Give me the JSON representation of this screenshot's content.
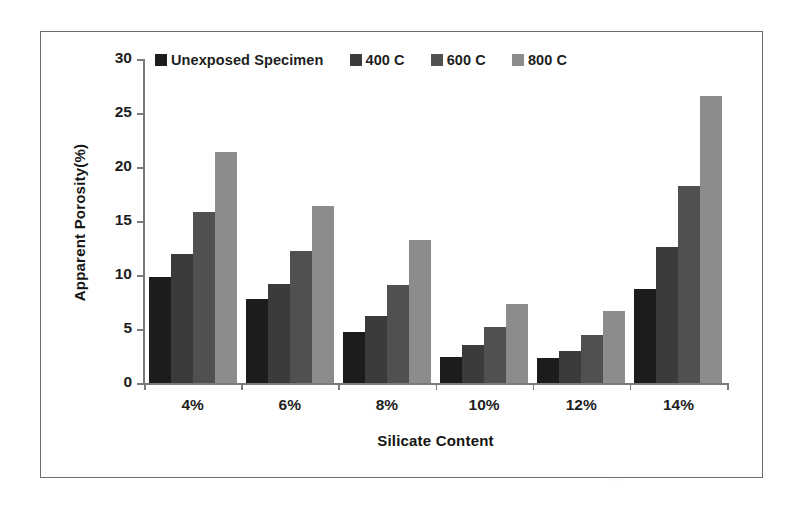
{
  "chart_data": {
    "type": "bar",
    "title": "",
    "xlabel": "Silicate Content",
    "ylabel": "Apparent Porosity(%)",
    "categories": [
      "4%",
      "6%",
      "8%",
      "10%",
      "12%",
      "14%"
    ],
    "series": [
      {
        "name": "Unexposed Specimen",
        "color": "#1c1c1c",
        "values": [
          9.8,
          7.8,
          4.7,
          2.4,
          2.3,
          8.7
        ]
      },
      {
        "name": "400 C",
        "color": "#3b3b3b",
        "values": [
          11.9,
          9.2,
          6.2,
          3.5,
          3.0,
          12.6
        ]
      },
      {
        "name": "600 C",
        "color": "#505050",
        "values": [
          15.8,
          12.2,
          9.1,
          5.2,
          4.4,
          18.2
        ]
      },
      {
        "name": "800 C",
        "color": "#8c8c8c",
        "values": [
          21.4,
          16.4,
          13.2,
          7.3,
          6.7,
          26.6
        ]
      }
    ],
    "ylim": [
      0,
      30
    ],
    "yticks": [
      0,
      5,
      10,
      15,
      20,
      25,
      30
    ],
    "ytick_labels": [
      "0",
      "5",
      "10",
      "15",
      "20",
      "25",
      "30"
    ],
    "grid": false,
    "legend_position": "top"
  }
}
